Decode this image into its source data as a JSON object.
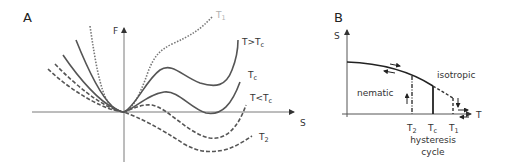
{
  "panelA": {
    "label": "A",
    "y_axis_label": "F",
    "x_axis_label": "S",
    "curves": [
      {
        "name": "T1",
        "label": "T",
        "label_sub": "1",
        "style": "dotted",
        "color": "#aaaaaa"
      },
      {
        "name": "T>Tc",
        "label": "T>T",
        "label_sub": "c",
        "style": "solid"
      },
      {
        "name": "Tc",
        "label": "T",
        "label_sub": "c",
        "style": "solid"
      },
      {
        "name": "T<Tc",
        "label": "T<T",
        "label_sub": "c",
        "style": "dashed"
      },
      {
        "name": "T2",
        "label": "T",
        "label_sub": "2",
        "style": "dashed"
      }
    ]
  },
  "panelB": {
    "label": "B",
    "y_axis_label": "S",
    "x_axis_label": "T",
    "region_labels": {
      "nematic": "nematic",
      "isotropic": "isotropic"
    },
    "tick_labels": [
      {
        "main": "T",
        "sub": "2"
      },
      {
        "main": "T",
        "sub": "c"
      },
      {
        "main": "T",
        "sub": "1"
      }
    ],
    "caption_line1": "hysteresis",
    "caption_line2": "cycle"
  }
}
